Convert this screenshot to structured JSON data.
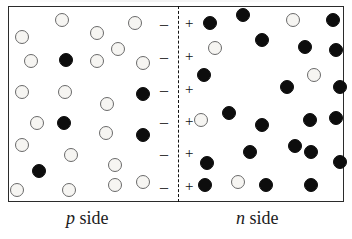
{
  "figure": {
    "background_color": "#ffffff",
    "border_color": "#2b2b2b",
    "junction_line_style": "dashed",
    "junction_line_color": "#111111"
  },
  "captions": {
    "p_side_symbol": "p",
    "p_side_text": " side",
    "n_side_symbol": "n",
    "n_side_text": " side"
  },
  "legend": {
    "open_circle_meaning": "hole / majority carrier on p side",
    "filled_circle_meaning": "electron / majority carrier on n side",
    "open_circle_color": "#f6f5f2",
    "open_circle_border": "#6a6a6a",
    "filled_circle_color": "#0d0d0d"
  },
  "junction_signs": {
    "minus_label": "–",
    "plus_label": "+",
    "count": 6,
    "minus_rows": [
      {
        "x": 160,
        "y": 16
      },
      {
        "x": 160,
        "y": 49
      },
      {
        "x": 160,
        "y": 82
      },
      {
        "x": 160,
        "y": 114
      },
      {
        "x": 160,
        "y": 146
      },
      {
        "x": 160,
        "y": 179
      }
    ],
    "plus_rows": [
      {
        "x": 185,
        "y": 16
      },
      {
        "x": 185,
        "y": 49
      },
      {
        "x": 185,
        "y": 82
      },
      {
        "x": 185,
        "y": 114
      },
      {
        "x": 185,
        "y": 146
      },
      {
        "x": 185,
        "y": 179
      }
    ]
  },
  "chart_data": {
    "type": "scatter",
    "xlabel": "",
    "ylabel": "",
    "series": [
      {
        "name": "p side open circles",
        "marker": "open",
        "points": [
          [
            22,
            37
          ],
          [
            62,
            20
          ],
          [
            31,
            61
          ],
          [
            97,
            33
          ],
          [
            135,
            23
          ],
          [
            118,
            49
          ],
          [
            97,
            61
          ],
          [
            143,
            63
          ],
          [
            22,
            92
          ],
          [
            65,
            92
          ],
          [
            37,
            123
          ],
          [
            107,
            104
          ],
          [
            106,
            133
          ],
          [
            22,
            145
          ],
          [
            71,
            155
          ],
          [
            17,
            190
          ],
          [
            69,
            190
          ],
          [
            115,
            165
          ],
          [
            115,
            185
          ],
          [
            143,
            182
          ]
        ]
      },
      {
        "name": "p side filled circles",
        "marker": "filled",
        "points": [
          [
            66,
            60
          ],
          [
            64,
            123
          ],
          [
            143,
            94
          ],
          [
            143,
            135
          ],
          [
            39,
            171
          ]
        ]
      },
      {
        "name": "n side filled circles",
        "marker": "filled",
        "points": [
          [
            210,
            23
          ],
          [
            243,
            15
          ],
          [
            262,
            40
          ],
          [
            333,
            20
          ],
          [
            305,
            47
          ],
          [
            336,
            50
          ],
          [
            287,
            87
          ],
          [
            340,
            87
          ],
          [
            204,
            75
          ],
          [
            229,
            113
          ],
          [
            262,
            125
          ],
          [
            310,
            120
          ],
          [
            311,
            152
          ],
          [
            207,
            163
          ],
          [
            250,
            152
          ],
          [
            295,
            146
          ],
          [
            340,
            162
          ],
          [
            205,
            185
          ],
          [
            266,
            185
          ],
          [
            311,
            185
          ],
          [
            336,
            118
          ]
        ]
      },
      {
        "name": "n side open circles",
        "marker": "open",
        "points": [
          [
            215,
            48
          ],
          [
            293,
            20
          ],
          [
            314,
            75
          ],
          [
            201,
            120
          ],
          [
            238,
            182
          ]
        ]
      }
    ],
    "annotations": [
      {
        "text": "–",
        "x": 160,
        "y": 16
      },
      {
        "text": "+",
        "x": 185,
        "y": 16
      },
      {
        "text": "–",
        "x": 160,
        "y": 49
      },
      {
        "text": "+",
        "x": 185,
        "y": 49
      },
      {
        "text": "–",
        "x": 160,
        "y": 82
      },
      {
        "text": "+",
        "x": 185,
        "y": 82
      },
      {
        "text": "–",
        "x": 160,
        "y": 114
      },
      {
        "text": "+",
        "x": 185,
        "y": 114
      },
      {
        "text": "–",
        "x": 160,
        "y": 146
      },
      {
        "text": "+",
        "x": 185,
        "y": 146
      },
      {
        "text": "–",
        "x": 160,
        "y": 179
      },
      {
        "text": "+",
        "x": 185,
        "y": 179
      },
      {
        "text": "p side",
        "x": 66,
        "y": 208
      },
      {
        "text": "n side",
        "x": 236,
        "y": 208
      }
    ],
    "grid": false,
    "legend_position": "none"
  }
}
